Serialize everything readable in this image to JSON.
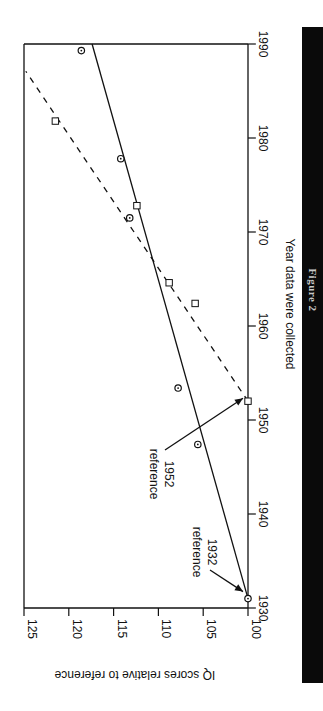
{
  "chart_data": {
    "type": "scatter",
    "orientation": "rotated 90° clockwise (year axis runs vertically, IQ axis horizontally)",
    "title": "",
    "caption": "Figure 2",
    "xlabel": "Year data were collected",
    "ylabel": "IQ scores relative to reference",
    "xlim": [
      1930,
      1990
    ],
    "ylim": [
      100,
      125
    ],
    "x_ticks": [
      1930,
      1940,
      1950,
      1960,
      1970,
      1980,
      1990
    ],
    "y_ticks": [
      100,
      105,
      110,
      115,
      120,
      125
    ],
    "grid": false,
    "legend": null,
    "series": [
      {
        "name": "reference 1932 (circles)",
        "marker": "circle",
        "points": [
          {
            "x": 1931,
            "y": 100.0
          },
          {
            "x": 1947.4,
            "y": 105.6
          },
          {
            "x": 1953.4,
            "y": 107.8
          },
          {
            "x": 1971.5,
            "y": 113.2
          },
          {
            "x": 1977.8,
            "y": 114.2
          },
          {
            "x": 1989.3,
            "y": 118.6
          }
        ],
        "fit_line": {
          "style": "solid",
          "from": {
            "x": 1931,
            "y": 100.0
          },
          "to": {
            "x": 1990,
            "y": 117.4
          }
        }
      },
      {
        "name": "reference 1952 (squares)",
        "marker": "square",
        "points": [
          {
            "x": 1952,
            "y": 100.0
          },
          {
            "x": 1962.4,
            "y": 105.9
          },
          {
            "x": 1964.6,
            "y": 108.8
          },
          {
            "x": 1972.8,
            "y": 112.4
          },
          {
            "x": 1981.8,
            "y": 121.5
          }
        ],
        "fit_line": {
          "style": "dashed",
          "from": {
            "x": 1952,
            "y": 100.0
          },
          "to": {
            "x": 1987.1,
            "y": 124.8
          }
        }
      }
    ],
    "annotations": [
      {
        "text_lines": [
          "reference",
          "1932"
        ],
        "arrow_to": {
          "x": 1931,
          "y": 100
        }
      },
      {
        "text_lines": [
          "reference",
          "1952"
        ],
        "arrow_to": {
          "x": 1952,
          "y": 100
        }
      }
    ]
  },
  "labels": {
    "xlabel": "Year data were collected",
    "ylabel": "IQ scores relative to reference",
    "caption": "Figure 2",
    "annot_1932_line1": "reference",
    "annot_1932_line2": "1932",
    "annot_1952_line1": "reference",
    "annot_1952_line2": "1952"
  },
  "colors": {
    "ink": "#111111",
    "background": "#ffffff",
    "caption_bar": "#0a0a0a",
    "caption_text": "#c8c8c8"
  }
}
